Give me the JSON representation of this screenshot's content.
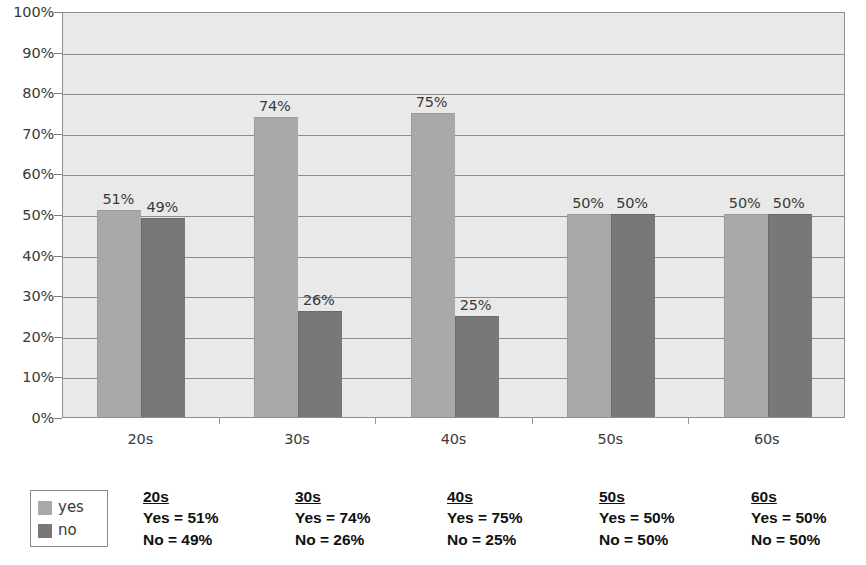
{
  "chart_data": {
    "type": "bar",
    "title": "",
    "subtitle": "",
    "xlabel": "",
    "ylabel": "",
    "categories": [
      "20s",
      "30s",
      "40s",
      "50s",
      "60s"
    ],
    "series": [
      {
        "name": "yes",
        "color": "#a9a9a9",
        "values": [
          51,
          74,
          75,
          50,
          50
        ]
      },
      {
        "name": "no",
        "color": "#787878",
        "values": [
          49,
          26,
          25,
          50,
          50
        ]
      }
    ],
    "value_labels": [
      [
        "51%",
        "49%"
      ],
      [
        "74%",
        "26%"
      ],
      [
        "75%",
        "25%"
      ],
      [
        "50%",
        "50%"
      ],
      [
        "50%",
        "50%"
      ]
    ],
    "ylim": [
      0,
      100
    ],
    "yticks": [
      0,
      10,
      20,
      30,
      40,
      50,
      60,
      70,
      80,
      90,
      100
    ],
    "ytick_labels": [
      "0%",
      "10%",
      "20%",
      "30%",
      "40%",
      "50%",
      "60%",
      "70%",
      "80%",
      "90%",
      "100%"
    ],
    "grid": true,
    "grid_axis": "y",
    "legend_position": "below-left",
    "plot_background": "#e9e9e9",
    "gridline_color": "#8e8e8e"
  },
  "legend": {
    "items": [
      {
        "label": "yes",
        "color": "#a9a9a9"
      },
      {
        "label": "no",
        "color": "#787878"
      }
    ]
  },
  "summary": {
    "columns": [
      {
        "header": "20s",
        "yes_line": "Yes = 51%",
        "no_line": "No = 49%"
      },
      {
        "header": "30s",
        "yes_line": "Yes = 74%",
        "no_line": "No = 26%"
      },
      {
        "header": "40s",
        "yes_line": "Yes = 75%",
        "no_line": "No = 25%"
      },
      {
        "header": "50s",
        "yes_line": "Yes = 50%",
        "no_line": "No = 50%"
      },
      {
        "header": "60s",
        "yes_line": "Yes = 50%",
        "no_line": "No = 50%"
      }
    ]
  }
}
